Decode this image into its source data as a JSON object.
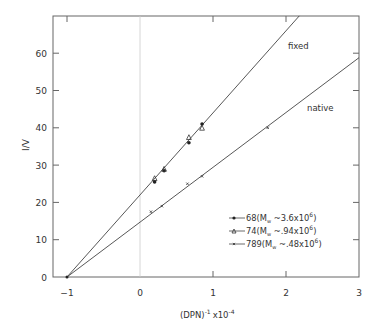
{
  "chart_data": {
    "type": "scatter",
    "title": "",
    "xlabel": "(DPN)⁻¹ x 10⁻⁴",
    "ylabel": "I / V",
    "xlim": [
      -1.2,
      3
    ],
    "ylim": [
      0,
      70
    ],
    "xticks": [
      -1,
      0,
      1,
      2,
      3
    ],
    "yticks": [
      0,
      10,
      20,
      30,
      40,
      50,
      60
    ],
    "grid": false,
    "vertical_reference_line_x": 0,
    "lines": [
      {
        "name": "fixed",
        "label": "fixed",
        "intercept_x": -1,
        "y_at_0": 22,
        "slope": 22
      },
      {
        "name": "native",
        "label": "native",
        "intercept_x": -1,
        "y_at_0": 14.7,
        "slope": 14.7
      }
    ],
    "series": [
      {
        "name": "68 (Mw ~ 3.6x10^6)",
        "marker": "filled-circle",
        "points": [
          [
            0.2,
            25.5
          ],
          [
            0.33,
            28.5
          ],
          [
            0.67,
            36
          ],
          [
            0.85,
            41
          ]
        ]
      },
      {
        "name": "74 (Mw ~ .94x10^6)",
        "marker": "triangle",
        "points": [
          [
            0.2,
            26.5
          ],
          [
            0.33,
            29
          ],
          [
            0.67,
            37.5
          ],
          [
            0.85,
            40
          ]
        ]
      },
      {
        "name": "789 (Mw ~ .48x10^6)",
        "marker": "small-x",
        "points": [
          [
            0.15,
            17.5
          ],
          [
            0.3,
            19
          ],
          [
            0.65,
            25
          ],
          [
            0.85,
            27
          ],
          [
            1.75,
            40
          ]
        ]
      }
    ],
    "legend": {
      "position": "lower-right",
      "entries": [
        {
          "id": "68",
          "mw": "3.6x10",
          "exp": "6"
        },
        {
          "id": "74",
          "mw": ".94x10",
          "exp": "6"
        },
        {
          "id": "789",
          "mw": ".48x10",
          "exp": "6"
        }
      ]
    }
  },
  "labels": {
    "fixed": "fixed",
    "native": "native",
    "ylabel": "I/V",
    "xlabel_base": "(DPN)",
    "xlabel_exp1": "-1",
    "xlabel_mid": "x10",
    "xlabel_exp2": "-4"
  }
}
